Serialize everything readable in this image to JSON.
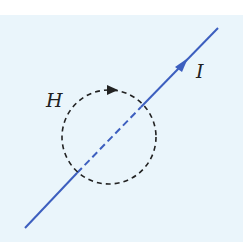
{
  "diagram": {
    "labels": {
      "field": "H",
      "current": "I"
    },
    "colors": {
      "background": "#eaf5fb",
      "wire": "#3d5fbf",
      "loop": "#222222"
    },
    "wire": {
      "x1": 25,
      "y1": 228,
      "x2": 218,
      "y2": 28,
      "arrow_at": [
        183,
        64
      ]
    },
    "loop": {
      "cx": 109,
      "cy": 137,
      "r": 47,
      "style": "dashed",
      "arrow_at": [
        112,
        97
      ]
    }
  }
}
